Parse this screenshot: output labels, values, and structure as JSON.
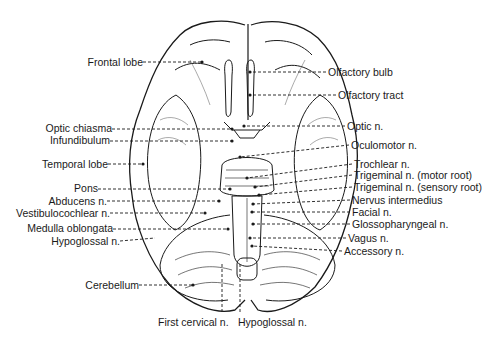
{
  "diagram": {
    "labels_left": [
      {
        "id": "frontal-lobe",
        "text": "Frontal lobe",
        "x": 143,
        "y": 62,
        "tx": 202,
        "ty": 62
      },
      {
        "id": "optic-chiasma",
        "text": "Optic chiasma",
        "x": 112,
        "y": 128,
        "tx": 232,
        "ty": 129
      },
      {
        "id": "infundibulum",
        "text": "Infundibulum",
        "x": 110,
        "y": 140,
        "tx": 232,
        "ty": 141
      },
      {
        "id": "temporal-lobe",
        "text": "Temporal lobe",
        "x": 108,
        "y": 164,
        "tx": 143,
        "ty": 164
      },
      {
        "id": "pons",
        "text": "Pons",
        "x": 98,
        "y": 188,
        "tx": 230,
        "ty": 189
      },
      {
        "id": "abducens-n",
        "text": "Abducens n.",
        "x": 107,
        "y": 201,
        "tx": 219,
        "ty": 201
      },
      {
        "id": "vestibulocochlear-n",
        "text": "Vestibulocochlear n.",
        "x": 110,
        "y": 213,
        "tx": 205,
        "ty": 213
      },
      {
        "id": "medulla-oblongata",
        "text": "Medulla oblongata",
        "x": 113,
        "y": 228,
        "tx": 228,
        "ty": 229
      },
      {
        "id": "hypoglossal-n-left",
        "text": "Hypoglossal n.",
        "x": 120,
        "y": 241,
        "tx": 155,
        "ty": 238
      },
      {
        "id": "cerebellum",
        "text": "Cerebellum",
        "x": 139,
        "y": 285,
        "tx": 193,
        "ty": 285
      }
    ],
    "labels_right": [
      {
        "id": "olfactory-bulb",
        "text": "Olfactory bulb",
        "x": 326,
        "y": 72,
        "tx": 250,
        "ty": 72
      },
      {
        "id": "olfactory-tract",
        "text": "Olfactory tract",
        "x": 336,
        "y": 95,
        "tx": 250,
        "ty": 95
      },
      {
        "id": "optic-n",
        "text": "Optic n.",
        "x": 345,
        "y": 126,
        "tx": 244,
        "ty": 126
      },
      {
        "id": "oculomotor-n",
        "text": "Oculomotor n.",
        "x": 349,
        "y": 145,
        "tx": 240,
        "ty": 157
      },
      {
        "id": "trochlear-n",
        "text": "Trochlear n.",
        "x": 352,
        "y": 164,
        "tx": 247,
        "ty": 178
      },
      {
        "id": "trigeminal-motor",
        "text": "Trigeminal n. (motor root)",
        "x": 352,
        "y": 175,
        "tx": 255,
        "ty": 187
      },
      {
        "id": "trigeminal-sensory",
        "text": "Trigeminal n. (sensory root)",
        "x": 352,
        "y": 187,
        "tx": 259,
        "ty": 195
      },
      {
        "id": "nervus-intermedius",
        "text": "Nervus intermedius",
        "x": 350,
        "y": 200,
        "tx": 253,
        "ty": 204
      },
      {
        "id": "facial-n",
        "text": "Facial n.",
        "x": 350,
        "y": 212,
        "tx": 252,
        "ty": 212
      },
      {
        "id": "glossopharyngeal-n",
        "text": "Glossopharyngeal n.",
        "x": 350,
        "y": 224,
        "tx": 253,
        "ty": 224
      },
      {
        "id": "vagus-n",
        "text": "Vagus n.",
        "x": 346,
        "y": 238,
        "tx": 250,
        "ty": 238
      },
      {
        "id": "accessory-n",
        "text": "Accessory n.",
        "x": 342,
        "y": 251,
        "tx": 252,
        "ty": 246
      }
    ],
    "labels_bottom": [
      {
        "id": "first-cervical-n",
        "text": "First cervical n.",
        "x": 158,
        "y": 322,
        "tx": 222,
        "ty": 312
      },
      {
        "id": "hypoglossal-n-bottom",
        "text": "Hypoglossal n.",
        "x": 238,
        "y": 322,
        "tx": 240,
        "ty": 312
      }
    ],
    "colors": {
      "line": "#1a1a1a",
      "background": "#ffffff"
    }
  }
}
